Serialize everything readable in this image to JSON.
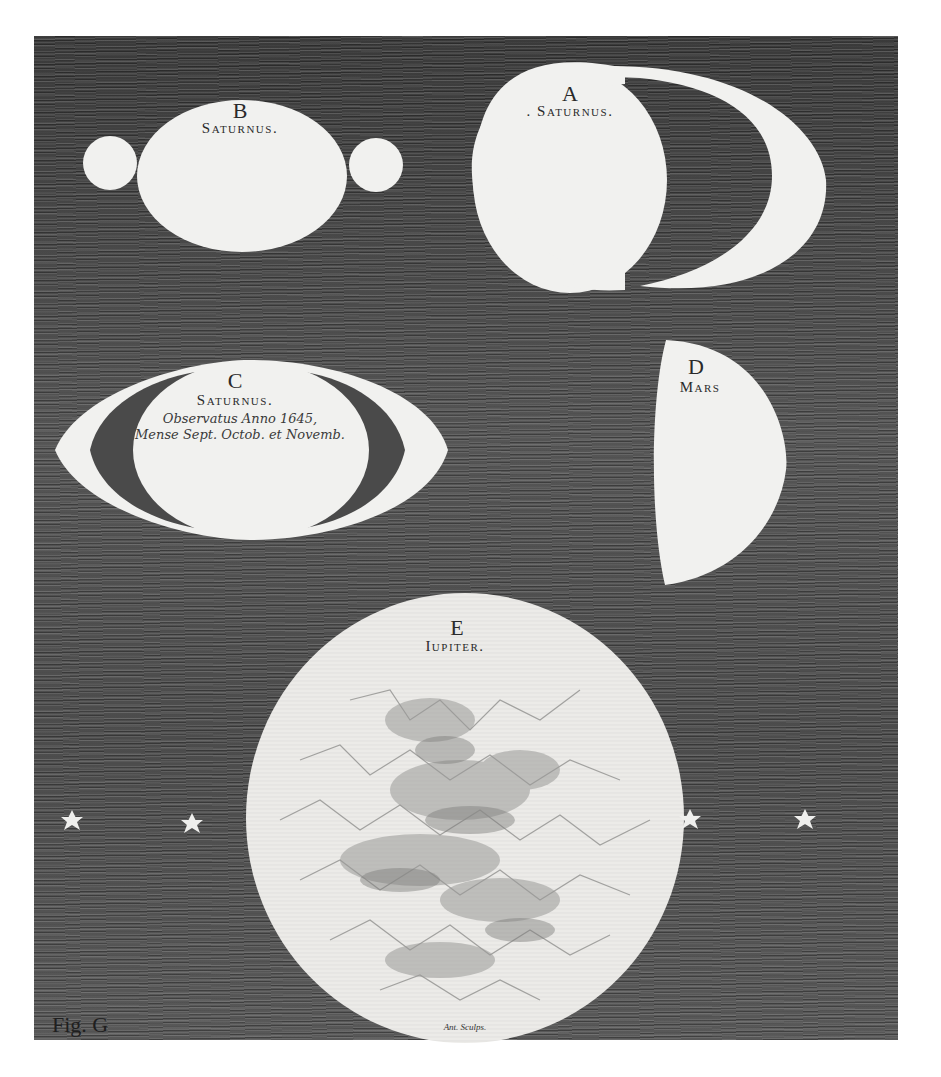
{
  "plate": {
    "background_color": "#4a4a4a",
    "figure_color": "#f2f2f0",
    "ink_color": "#2a2a2a",
    "figure_mark": "Fig. G"
  },
  "figures": {
    "A": {
      "letter": "A",
      "name": ". Saturnus.",
      "depiction": "planet disc with two large crescent ansae (handles) on either side"
    },
    "B": {
      "letter": "B",
      "name": "Saturnus.",
      "depiction": "oval disc with two small round lobes on either side"
    },
    "C": {
      "letter": "C",
      "name": "Saturnus.",
      "caption_line1": "Observatus Anno 1645,",
      "caption_line2": "Mense Sept. Octob. et Novemb.",
      "depiction": "oval disc with elliptical ring-like ansae"
    },
    "D": {
      "letter": "D",
      "name": "Mars",
      "depiction": "gibbous disc, flat left edge"
    },
    "E": {
      "letter": "E",
      "name": "Iupiter.",
      "engraver_signature": "Ant. Sculps.",
      "depiction": "large disc with dark cloud band markings"
    }
  },
  "stars": [
    {
      "name": "star-1",
      "x": 72,
      "y": 823
    },
    {
      "name": "star-2",
      "x": 192,
      "y": 826
    },
    {
      "name": "star-3",
      "x": 690,
      "y": 822
    },
    {
      "name": "star-4",
      "x": 805,
      "y": 822
    }
  ]
}
